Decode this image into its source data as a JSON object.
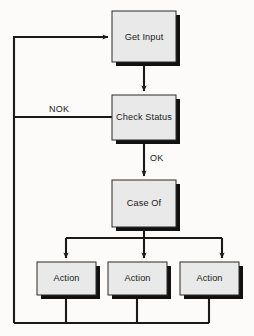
{
  "diagram": {
    "type": "flowchart",
    "colors": {
      "background": "#fcfbfa",
      "node_fill": "#e9e9e9",
      "node_border": "#2b2b2b",
      "node_shadow": "#111111",
      "line": "#1a1a1a",
      "text": "#1a1a1a"
    },
    "nodes": [
      {
        "id": "get-input",
        "label": "Get Input",
        "x": 112,
        "y": 11,
        "w": 64,
        "h": 51
      },
      {
        "id": "check-status",
        "label": "Check Status",
        "x": 112,
        "y": 95,
        "w": 64,
        "h": 45
      },
      {
        "id": "case-of",
        "label": "Case Of",
        "x": 112,
        "y": 180,
        "w": 64,
        "h": 47
      },
      {
        "id": "action-1",
        "label": "Action",
        "x": 37,
        "y": 262,
        "w": 59,
        "h": 33
      },
      {
        "id": "action-2",
        "label": "Action",
        "x": 108,
        "y": 262,
        "w": 59,
        "h": 33
      },
      {
        "id": "action-3",
        "label": "Action",
        "x": 180,
        "y": 262,
        "w": 59,
        "h": 33
      }
    ],
    "edge_labels": [
      {
        "id": "nok-label",
        "text": "NOK",
        "x": 61,
        "y": 111
      },
      {
        "id": "ok-label",
        "text": "OK",
        "x": 150,
        "y": 160
      }
    ],
    "edges": [
      {
        "id": "get-input-to-check-status",
        "from": "get-input",
        "to": "check-status",
        "arrow": true
      },
      {
        "id": "check-status-to-case-of",
        "from": "check-status",
        "to": "case-of",
        "label": "OK",
        "arrow": true
      },
      {
        "id": "check-status-nok-return",
        "from": "check-status",
        "to": "get-input",
        "label": "NOK",
        "arrow": true
      },
      {
        "id": "case-of-to-action-1",
        "from": "case-of",
        "to": "action-1",
        "arrow": true
      },
      {
        "id": "case-of-to-action-2",
        "from": "case-of",
        "to": "action-2",
        "arrow": true
      },
      {
        "id": "case-of-to-action-3",
        "from": "case-of",
        "to": "action-3",
        "arrow": true
      },
      {
        "id": "action-1-to-loop",
        "from": "action-1",
        "to": "get-input",
        "arrow": false
      },
      {
        "id": "action-2-to-loop",
        "from": "action-2",
        "to": "get-input",
        "arrow": false
      },
      {
        "id": "action-3-to-loop",
        "from": "action-3",
        "to": "get-input",
        "arrow": false
      }
    ]
  }
}
